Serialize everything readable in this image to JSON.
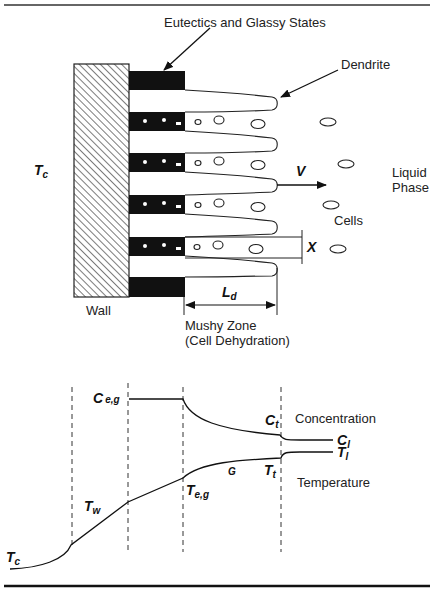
{
  "figure": {
    "top_diagram": {
      "labels": {
        "eutectics": "Eutectics and Glassy States",
        "dendrite": "Dendrite",
        "wall": "Wall",
        "liquid_line1": "Liquid",
        "liquid_line2": "Phase",
        "cells": "Cells",
        "mushy_line1": "Mushy Zone",
        "mushy_line2": "(Cell Dehydration)"
      },
      "symbols": {
        "tc_main": "T",
        "tc_sub": "c",
        "velocity": "V",
        "spacing": "X",
        "length_main": "L",
        "length_sub": "d"
      }
    },
    "bottom_diagram": {
      "labels": {
        "concentration": "Concentration",
        "temperature": "Temperature"
      },
      "symbols": {
        "ceg_main": "C",
        "ceg_sub": "e,g",
        "ct_main": "C",
        "ct_sub": "t",
        "cl_main": "C",
        "cl_sub": "l",
        "tl_main": "T",
        "tl_sub": "l",
        "tt_main": "T",
        "tt_sub": "t",
        "g": "G",
        "teg_main": "T",
        "teg_sub": "e,g",
        "tw_main": "T",
        "tw_sub": "w",
        "tc_main": "T",
        "tc_sub": "c"
      }
    }
  }
}
